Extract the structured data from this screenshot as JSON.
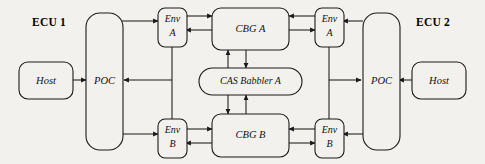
{
  "diagram": {
    "type": "block-diagram",
    "title_labels": [
      {
        "id": "ecu1",
        "text": "ECU 1"
      },
      {
        "id": "ecu2",
        "text": "ECU 2"
      }
    ],
    "nodes": {
      "host_left": {
        "label": "Host"
      },
      "poc_left": {
        "label": "POC"
      },
      "env_a_left": {
        "label_line1": "Env",
        "label_line2": "A"
      },
      "env_b_left": {
        "label_line1": "Env",
        "label_line2": "B"
      },
      "cbg_a": {
        "label": "CBG A"
      },
      "cbg_b": {
        "label": "CBG B"
      },
      "cas_babbler_a": {
        "label": "CAS Babbler A"
      },
      "env_a_right": {
        "label_line1": "Env",
        "label_line2": "A"
      },
      "env_b_right": {
        "label_line1": "Env",
        "label_line2": "B"
      },
      "poc_right": {
        "label": "POC"
      },
      "host_right": {
        "label": "Host"
      }
    },
    "edges": [
      {
        "from": "host_left",
        "to": "poc_left",
        "direction": "right"
      },
      {
        "from": "poc_left",
        "to": "env_a_left",
        "direction": "right"
      },
      {
        "from": "poc_left",
        "to": "env_b_left",
        "direction": "right"
      },
      {
        "from": "env_a_left",
        "to": "cbg_a",
        "direction": "right"
      },
      {
        "from": "cbg_a",
        "to": "env_a_left",
        "direction": "left"
      },
      {
        "from": "env_b_left",
        "to": "cbg_b",
        "direction": "right"
      },
      {
        "from": "cbg_b",
        "to": "env_b_left",
        "direction": "left"
      },
      {
        "from": "cbg_a",
        "to": "cas_babbler_a",
        "direction": "down"
      },
      {
        "from": "cas_babbler_a",
        "to": "cbg_a",
        "direction": "up"
      },
      {
        "from": "cas_babbler_a",
        "to": "cbg_b",
        "direction": "down"
      },
      {
        "from": "cbg_b",
        "to": "cas_babbler_a",
        "direction": "up"
      },
      {
        "from": "env_a_right",
        "to": "cbg_a",
        "direction": "left"
      },
      {
        "from": "cbg_a",
        "to": "env_a_right",
        "direction": "right"
      },
      {
        "from": "env_b_right",
        "to": "cbg_b",
        "direction": "left"
      },
      {
        "from": "cbg_b",
        "to": "env_b_right",
        "direction": "right"
      },
      {
        "from": "poc_right",
        "to": "env_a_right",
        "direction": "left"
      },
      {
        "from": "poc_right",
        "to": "env_b_right",
        "direction": "left"
      },
      {
        "from": "host_right",
        "to": "poc_right",
        "direction": "left"
      },
      {
        "from": "env_bus_left",
        "to": "poc_left",
        "direction": "left"
      },
      {
        "from": "env_bus_right",
        "to": "poc_right",
        "direction": "right"
      }
    ],
    "colors": {
      "background": "#f2f1ee",
      "stroke": "#1a1a1a",
      "node_fill": "#f2f1ee",
      "text": "#111111"
    }
  }
}
